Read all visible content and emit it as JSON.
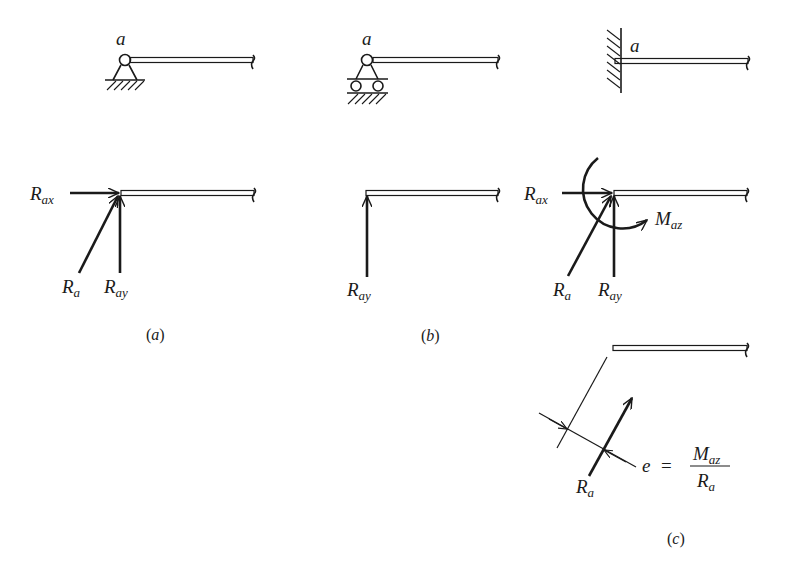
{
  "figure": {
    "panels": [
      {
        "id": "a",
        "caption": "a",
        "support_type": "pin",
        "point_label": "a",
        "forces": [
          {
            "symbol": "R",
            "subscript": "ax",
            "direction": "horizontal"
          },
          {
            "symbol": "R",
            "subscript": "a",
            "direction": "inclined"
          },
          {
            "symbol": "R",
            "subscript": "ay",
            "direction": "vertical"
          }
        ]
      },
      {
        "id": "b",
        "caption": "b",
        "support_type": "roller",
        "point_label": "a",
        "forces": [
          {
            "symbol": "R",
            "subscript": "ay",
            "direction": "vertical"
          }
        ]
      },
      {
        "id": "c",
        "caption": "c",
        "support_type": "fixed",
        "point_label": "a",
        "forces": [
          {
            "symbol": "R",
            "subscript": "ax",
            "direction": "horizontal"
          },
          {
            "symbol": "R",
            "subscript": "a",
            "direction": "inclined"
          },
          {
            "symbol": "R",
            "subscript": "ay",
            "direction": "vertical"
          }
        ],
        "moment": {
          "symbol": "M",
          "subscript": "az"
        },
        "equivalent": {
          "force": {
            "symbol": "R",
            "subscript": "a"
          },
          "eccentricity": {
            "lhs": "e",
            "eq": "=",
            "numerator": {
              "symbol": "M",
              "subscript": "az"
            },
            "denominator": {
              "symbol": "R",
              "subscript": "a"
            }
          }
        }
      }
    ],
    "paren_open": "(",
    "paren_close": ")"
  }
}
